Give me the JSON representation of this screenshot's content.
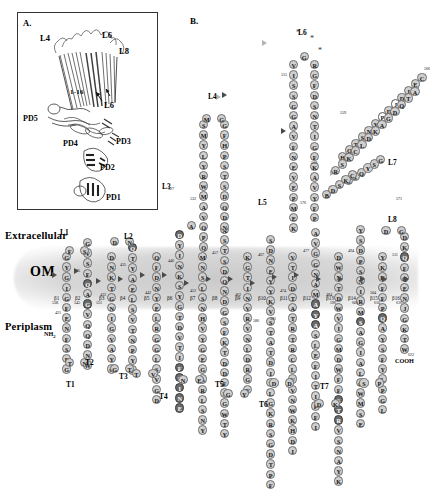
{
  "figure": {
    "panel_a": {
      "label": "A.",
      "structure_labels": [
        {
          "text": "L4",
          "x": 22,
          "y": 20
        },
        {
          "text": "L6",
          "x": 84,
          "y": 17
        },
        {
          "text": "L8",
          "x": 101,
          "y": 33
        },
        {
          "text": "1-16",
          "x": 52,
          "y": 75
        },
        {
          "text": "L6",
          "x": 86,
          "y": 87
        }
      ],
      "domain_labels": [
        {
          "text": "PD5",
          "x": 5,
          "y": 101
        },
        {
          "text": "PD4",
          "x": 45,
          "y": 126
        },
        {
          "text": "PD3",
          "x": 98,
          "y": 124
        },
        {
          "text": "PD2",
          "x": 82,
          "y": 150
        },
        {
          "text": "PD1",
          "x": 88,
          "y": 180
        }
      ]
    },
    "panel_b": {
      "label": "B.",
      "compartments": {
        "extracellular": "Extracellular",
        "membrane": "OM",
        "periplasm": "Periplasm"
      },
      "termini": {
        "n_terminus": "NH",
        "n_sub": "2",
        "c_terminus": "COOH"
      },
      "loop_labels": [
        "L1",
        "L2",
        "L3",
        "L4",
        "L5",
        "L6",
        "L7",
        "L8"
      ],
      "turn_labels": [
        "T1",
        "T2",
        "T3",
        "T4",
        "T5",
        "T6",
        "T7"
      ],
      "strand_labels": [
        "β1",
        "β2",
        "β3",
        "β4",
        "β5",
        "β6",
        "β7",
        "β8",
        "β9",
        "β10",
        "β11",
        "β12",
        "β13",
        "β14",
        "β15",
        "β16"
      ],
      "residue_numbers": [
        "421",
        "425",
        "432",
        "435",
        "442",
        "446",
        "452",
        "457",
        "462",
        "467",
        "474",
        "477",
        "484",
        "494",
        "504",
        "511",
        "515",
        "519",
        "527",
        "532",
        "538",
        "545",
        "551",
        "559",
        "566",
        "571",
        "576",
        "586",
        "591",
        "596",
        "601",
        "610",
        "616",
        "622",
        "631",
        "638",
        "644",
        "650",
        "658",
        "664",
        "671",
        "677",
        "683",
        "690",
        "696",
        "701",
        "708",
        "714",
        "721",
        "729",
        "735",
        "741",
        "748",
        "755",
        "761",
        "768",
        "775",
        "781",
        "788",
        "795",
        "801",
        "808",
        "815"
      ],
      "asterisk_count": 3
    }
  },
  "colors": {
    "residue_fill": "#cfcfcf",
    "residue_dark": "#6a6a6a",
    "residue_open": "#ffffff",
    "membrane_band": "#9a9a9a",
    "text": "#000000"
  },
  "sequence_columns": [
    {
      "id": "b1-up",
      "x": 62,
      "y_start": 318,
      "dir": "up",
      "start_num": "421",
      "letters": [
        [
          "G",
          0
        ],
        [
          "S",
          0
        ],
        [
          "E",
          0
        ],
        [
          "F",
          0
        ],
        [
          "N",
          0
        ],
        [
          "F",
          0
        ],
        [
          "E",
          0
        ],
        [
          "G",
          0
        ],
        [
          "I",
          0
        ],
        [
          "G",
          0
        ],
        [
          "Y",
          0
        ],
        [
          "G",
          0
        ],
        [
          "T",
          0
        ]
      ]
    },
    {
      "id": "L1",
      "letters": [
        [
          "F",
          0
        ],
        [
          "S",
          0
        ]
      ]
    },
    {
      "id": "b2-down",
      "x": 83,
      "y_start": 238,
      "dir": "down",
      "start_num": "425",
      "letters": [
        [
          "G",
          0
        ],
        [
          "V",
          0
        ],
        [
          "S",
          0
        ],
        [
          "F",
          0
        ],
        [
          "Q",
          1
        ],
        [
          "A",
          0
        ],
        [
          "G",
          1
        ],
        [
          "V",
          0
        ],
        [
          "Q",
          0
        ],
        [
          "Q",
          0
        ],
        [
          "D",
          0
        ],
        [
          "N",
          0
        ],
        [
          "W",
          0
        ],
        [
          "L",
          0
        ],
        [
          "G",
          0
        ]
      ]
    },
    {
      "id": "b3-up",
      "x": 107,
      "y_start": 330,
      "dir": "up",
      "start_num": "452",
      "letters": [
        [
          "T",
          0
        ],
        [
          "G",
          0
        ],
        [
          "T",
          0
        ],
        [
          "Y",
          0
        ],
        [
          "A",
          0
        ],
        [
          "V",
          0
        ],
        [
          "G",
          0
        ],
        [
          "I",
          0
        ],
        [
          "N",
          0
        ],
        [
          "G",
          0
        ],
        [
          "T",
          0
        ],
        [
          "K",
          0
        ],
        [
          "N",
          0
        ],
        [
          "D",
          0
        ]
      ]
    },
    {
      "id": "b4-down",
      "x": 128,
      "y_start": 243,
      "dir": "down",
      "start_num": "467",
      "letters": [
        [
          "Q",
          1
        ],
        [
          "T",
          0
        ],
        [
          "Y",
          0
        ],
        [
          "A",
          0
        ],
        [
          "E",
          0
        ],
        [
          "L",
          0
        ],
        [
          "S",
          0
        ],
        [
          "V",
          0
        ],
        [
          "T",
          0
        ],
        [
          "N",
          0
        ],
        [
          "P",
          0
        ],
        [
          "Y",
          0
        ],
        [
          "F",
          0
        ],
        [
          "T",
          0
        ],
        [
          "V",
          0
        ]
      ]
    },
    {
      "id": "b5-up",
      "x": 152,
      "y_start": 348,
      "dir": "up",
      "start_num": "477",
      "letters": [
        [
          "D",
          0
        ],
        [
          "G",
          0
        ],
        [
          "V",
          0
        ],
        [
          "S",
          0
        ],
        [
          "I",
          0
        ],
        [
          "G",
          0
        ],
        [
          "G",
          0
        ],
        [
          "R",
          0
        ],
        [
          "L",
          0
        ],
        [
          "E",
          0
        ],
        [
          "Y",
          0
        ],
        [
          "N",
          0
        ],
        [
          "D",
          0
        ],
        [
          "E",
          0
        ],
        [
          "F",
          0
        ],
        [
          "Q",
          0
        ],
        [
          "A",
          0
        ]
      ]
    },
    {
      "id": "L3",
      "letters": [
        [
          "A",
          0
        ],
        [
          "D",
          0
        ],
        [
          "D",
          0
        ],
        [
          "D",
          0
        ],
        [
          "A",
          0
        ],
        [
          "Q",
          0
        ],
        [
          "E",
          0
        ],
        [
          "D",
          0
        ],
        [
          "N",
          0
        ],
        [
          "Y",
          0
        ],
        [
          "E",
          0
        ],
        [
          "L",
          0
        ]
      ]
    },
    {
      "id": "b6-down",
      "x": 175,
      "y_start": 230,
      "dir": "down",
      "start_num": "494",
      "letters": [
        [
          "D",
          1
        ],
        [
          "Y",
          0
        ],
        [
          "I",
          0
        ],
        [
          "N",
          0
        ],
        [
          "K",
          0
        ],
        [
          "S",
          0
        ],
        [
          "Y",
          0
        ],
        [
          "G",
          0
        ],
        [
          "T",
          0
        ],
        [
          "D",
          0
        ],
        [
          "V",
          0
        ],
        [
          "T",
          0
        ],
        [
          "I",
          0
        ],
        [
          "F",
          1
        ],
        [
          "P",
          1
        ],
        [
          "I",
          1
        ],
        [
          "N",
          1
        ],
        [
          "E",
          1
        ]
      ]
    },
    {
      "id": "b7-up",
      "x": 198,
      "y_start": 355,
      "dir": "up",
      "start_num": "511",
      "letters": [
        [
          "Y",
          0
        ],
        [
          "N",
          0
        ],
        [
          "S",
          0
        ],
        [
          "L",
          0
        ],
        [
          "S",
          0
        ],
        [
          "N",
          0
        ],
        [
          "H",
          0
        ],
        [
          "V",
          0
        ],
        [
          "Y",
          0
        ],
        [
          "G",
          0
        ],
        [
          "E",
          0
        ],
        [
          "G",
          0
        ],
        [
          "A",
          0
        ],
        [
          "R",
          0
        ],
        [
          "L",
          0
        ],
        [
          "S",
          0
        ],
        [
          "N",
          0
        ],
        [
          "Y",
          0
        ]
      ]
    },
    {
      "id": "b8-down",
      "x": 220,
      "y_start": 225,
      "dir": "down",
      "start_num": "527",
      "letters": [
        [
          "S",
          0
        ],
        [
          "T",
          0
        ],
        [
          "S",
          0
        ],
        [
          "D",
          0
        ],
        [
          "Q",
          0
        ],
        [
          "N",
          0
        ],
        [
          "D",
          0
        ],
        [
          "G",
          0
        ],
        [
          "S",
          0
        ],
        [
          "F",
          0
        ],
        [
          "K",
          0
        ],
        [
          "T",
          0
        ],
        [
          "D",
          0
        ],
        [
          "D",
          0
        ],
        [
          "F",
          0
        ],
        [
          "N",
          0
        ],
        [
          "G",
          0
        ],
        [
          "W",
          0
        ],
        [
          "T",
          0
        ],
        [
          "Y",
          0
        ]
      ]
    },
    {
      "id": "b9-up",
      "x": 243,
      "y_start": 345,
      "dir": "up",
      "start_num": "545",
      "letters": [
        [
          "R",
          0
        ],
        [
          "V",
          0
        ],
        [
          "N",
          0
        ],
        [
          "L",
          0
        ],
        [
          "D",
          0
        ],
        [
          "R",
          0
        ],
        [
          "G",
          0
        ],
        [
          "Y",
          0
        ],
        [
          "T",
          0
        ],
        [
          "G",
          0
        ],
        [
          "K",
          0
        ],
        [
          "Y",
          0
        ],
        [
          "S",
          0
        ],
        [
          "V",
          0
        ],
        [
          "T",
          0
        ],
        [
          "P",
          0
        ],
        [
          "I",
          1
        ],
        [
          "G",
          0
        ]
      ]
    },
    {
      "id": "L5",
      "letters": [
        [
          "S",
          0
        ],
        [
          "D",
          0
        ],
        [
          "N",
          0
        ],
        [
          "E",
          0
        ]
      ]
    },
    {
      "id": "b10-down",
      "x": 266,
      "y_start": 235,
      "dir": "down",
      "start_num": "566",
      "letters": [
        [
          "Y",
          0
        ],
        [
          "Y",
          0
        ],
        [
          "K",
          0
        ],
        [
          "V",
          0
        ],
        [
          "S",
          0
        ],
        [
          "T",
          0
        ],
        [
          "A",
          0
        ],
        [
          "T",
          0
        ],
        [
          "D",
          0
        ],
        [
          "I",
          0
        ],
        [
          "T",
          0
        ],
        [
          "L",
          0
        ],
        [
          "G",
          0
        ],
        [
          "K",
          0
        ],
        [
          "R",
          0
        ],
        [
          "S",
          0
        ],
        [
          "G",
          0
        ],
        [
          "D",
          0
        ],
        [
          "T",
          0
        ],
        [
          "P",
          0
        ],
        [
          "F",
          0
        ]
      ]
    },
    {
      "id": "b11-up",
      "x": 288,
      "y_start": 330,
      "dir": "up",
      "start_num": "586",
      "letters": [
        [
          "M",
          0
        ],
        [
          "T",
          0
        ],
        [
          "G",
          0
        ],
        [
          "V",
          0
        ],
        [
          "A",
          0
        ],
        [
          "N",
          0
        ],
        [
          "R",
          0
        ],
        [
          "T",
          0
        ],
        [
          "R",
          0
        ],
        [
          "C",
          0
        ],
        [
          "L",
          0
        ],
        [
          "V",
          0
        ],
        [
          "V",
          0
        ],
        [
          "N",
          0
        ],
        [
          "W",
          0
        ],
        [
          "K",
          0
        ],
        [
          "H",
          0
        ],
        [
          "D",
          0
        ],
        [
          "I",
          0
        ]
      ]
    },
    {
      "id": "b12-down",
      "x": 311,
      "y_start": 228,
      "dir": "down",
      "start_num": "610",
      "letters": [
        [
          "A",
          0
        ],
        [
          "V",
          0
        ],
        [
          "G",
          0
        ],
        [
          "G",
          0
        ],
        [
          "N",
          0
        ],
        [
          "A",
          0
        ],
        [
          "M",
          0
        ],
        [
          "A",
          1
        ],
        [
          "Y",
          1
        ],
        [
          "A",
          1
        ],
        [
          "S",
          0
        ],
        [
          "L",
          0
        ],
        [
          "E",
          0
        ],
        [
          "F",
          0
        ],
        [
          "I",
          0
        ],
        [
          "T",
          0
        ],
        [
          "I",
          0
        ],
        [
          "P",
          0
        ],
        [
          "F",
          0
        ],
        [
          "I",
          0
        ]
      ]
    },
    {
      "id": "b13-up",
      "x": 334,
      "y_start": 338,
      "dir": "up",
      "start_num": "631",
      "letters": [
        [
          "D",
          0
        ],
        [
          "W",
          0
        ],
        [
          "N",
          0
        ],
        [
          "T",
          0
        ],
        [
          "D",
          0
        ],
        [
          "W",
          0
        ],
        [
          "V",
          0
        ],
        [
          "I",
          0
        ],
        [
          "G",
          0
        ],
        [
          "M",
          0
        ],
        [
          "D",
          0
        ],
        [
          "W",
          0
        ],
        [
          "F",
          0
        ],
        [
          "F",
          0
        ],
        [
          "S",
          1
        ],
        [
          "T",
          1
        ],
        [
          "R",
          1
        ],
        [
          "V",
          0
        ],
        [
          "S",
          0
        ],
        [
          "N",
          0
        ],
        [
          "A",
          0
        ],
        [
          "Y",
          0
        ],
        [
          "K",
          0
        ]
      ]
    },
    {
      "id": "b14-down",
      "x": 356,
      "y_start": 225,
      "dir": "down",
      "start_num": "658",
      "letters": [
        [
          "Y",
          0
        ],
        [
          "S",
          0
        ],
        [
          "D",
          0
        ],
        [
          "P",
          0
        ],
        [
          "S",
          0
        ],
        [
          "N",
          0
        ],
        [
          "I",
          0
        ],
        [
          "R",
          0
        ],
        [
          "M",
          0
        ],
        [
          "S",
          1
        ],
        [
          "A",
          0
        ],
        [
          "G",
          0
        ],
        [
          "I",
          0
        ],
        [
          "A",
          0
        ],
        [
          "L",
          0
        ],
        [
          "Q",
          0
        ],
        [
          "W",
          0
        ],
        [
          "M",
          0
        ],
        [
          "S",
          0
        ],
        [
          "E",
          0
        ]
      ]
    },
    {
      "id": "b15-up",
      "x": 378,
      "y_start": 318,
      "dir": "up",
      "start_num": "690",
      "letters": [
        [
          "Y",
          0
        ],
        [
          "K",
          0
        ],
        [
          "K",
          0
        ],
        [
          "F",
          0
        ],
        [
          "F",
          0
        ],
        [
          "P",
          0
        ],
        [
          "Q",
          1
        ],
        [
          "A",
          0
        ],
        [
          "Y",
          0
        ],
        [
          "S",
          0
        ],
        [
          "F",
          0
        ],
        [
          "Y",
          0
        ],
        [
          "L",
          0
        ],
        [
          "P",
          0
        ],
        [
          "G",
          0
        ],
        [
          "L",
          0
        ]
      ]
    },
    {
      "id": "L8",
      "letters": [
        [
          "D",
          0
        ],
        [
          "G",
          0
        ]
      ]
    },
    {
      "id": "b16-down",
      "x": 400,
      "y_start": 232,
      "dir": "down",
      "start_num": "801",
      "letters": [
        [
          "D",
          0
        ],
        [
          "K",
          0
        ],
        [
          "Q",
          1
        ],
        [
          "F",
          0
        ],
        [
          "Q",
          0
        ],
        [
          "E",
          0
        ],
        [
          "N",
          0
        ],
        [
          "J",
          0
        ],
        [
          "G",
          0
        ],
        [
          "K",
          0
        ],
        [
          "T",
          0
        ],
        [
          "W",
          0
        ]
      ]
    }
  ]
}
